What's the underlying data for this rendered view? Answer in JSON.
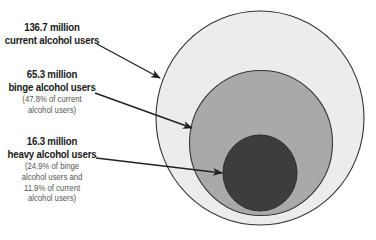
{
  "diagram": {
    "colors": {
      "outer_fill": "#ececec",
      "middle_fill": "#a9a9a9",
      "inner_fill": "#3d3d3d",
      "stroke": "#333333",
      "arrow": "#222222"
    },
    "groups": [
      {
        "id": "current",
        "value_label": "136.7 million",
        "name_label": "current alcohol users",
        "note_lines": []
      },
      {
        "id": "binge",
        "value_label": "65.3 million",
        "name_label": "binge alcohol users",
        "note_lines": [
          "(47.8% of current",
          "alcohol users)"
        ]
      },
      {
        "id": "heavy",
        "value_label": "16.3 million",
        "name_label": "heavy alcohol users",
        "note_lines": [
          "(24.9% of binge",
          "alcohol users and",
          "11.9% of current",
          "alcohol users)"
        ]
      }
    ]
  }
}
